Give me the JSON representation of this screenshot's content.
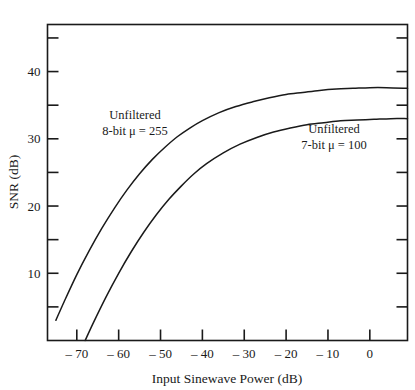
{
  "chart_data": {
    "type": "line",
    "title": "",
    "xlabel": "Input Sinewave Power (dB)",
    "ylabel": "SNR (dB)",
    "xlim": [
      -77,
      9
    ],
    "ylim": [
      0,
      47
    ],
    "grid": false,
    "legend_position": "inline-annotations",
    "x_major_ticks": [
      -70,
      -60,
      -50,
      -40,
      -30,
      -20,
      -10,
      0
    ],
    "x_tick_labels": [
      "– 70",
      "– 60",
      "– 50",
      "– 40",
      "– 30",
      "– 20",
      "– 10",
      "0"
    ],
    "y_major_ticks": [
      10,
      20,
      30,
      40
    ],
    "y_tick_labels": [
      "10",
      "20",
      "30",
      "40"
    ],
    "y_minor_ticks": [
      5,
      15,
      25,
      35,
      45
    ],
    "series": [
      {
        "name": "Unfiltered 8-bit μ = 255",
        "annotation_line1": "Unfiltered",
        "annotation_line2": "8-bit μ = 255",
        "x": [
          -75,
          -73,
          -70,
          -67,
          -64,
          -61,
          -58,
          -55,
          -52,
          -49,
          -46,
          -43,
          -40,
          -36,
          -32,
          -28,
          -24,
          -20,
          -16,
          -12,
          -8,
          -4,
          0,
          4,
          9
        ],
        "y": [
          3.0,
          5.8,
          9.8,
          13.4,
          16.7,
          19.7,
          22.4,
          24.8,
          26.9,
          28.7,
          30.3,
          31.6,
          32.7,
          33.9,
          34.8,
          35.5,
          36.1,
          36.6,
          36.9,
          37.2,
          37.4,
          37.5,
          37.6,
          37.6,
          37.5
        ]
      },
      {
        "name": "Unfiltered 7-bit μ = 100",
        "annotation_line1": "Unfiltered",
        "annotation_line2": "7-bit μ = 100",
        "x": [
          -68,
          -66,
          -63,
          -60,
          -57,
          -54,
          -51,
          -48,
          -45,
          -42,
          -39,
          -35,
          -31,
          -27,
          -23,
          -19,
          -15,
          -11,
          -7,
          -3,
          1,
          5,
          9
        ],
        "y": [
          0.0,
          2.7,
          6.5,
          10.0,
          13.2,
          16.1,
          18.7,
          21.0,
          23.0,
          24.8,
          26.3,
          27.9,
          29.2,
          30.2,
          31.0,
          31.6,
          32.1,
          32.4,
          32.7,
          32.8,
          32.9,
          33.0,
          33.0
        ]
      }
    ],
    "annotations": [
      {
        "text_line1": "Unfiltered",
        "text_line2": "8-bit μ = 255",
        "x_px": 135,
        "y_px": 119
      },
      {
        "text_line1": "Unfiltered",
        "text_line2": "7-bit μ = 100",
        "x_px": 334,
        "y_px": 133
      }
    ],
    "colors": {
      "curve": "#1a1a1a",
      "axis": "#1a1a1a",
      "background": "#ffffff"
    }
  },
  "axes": {
    "x_title": "Input Sinewave Power (dB)",
    "y_title": "SNR (dB)"
  }
}
